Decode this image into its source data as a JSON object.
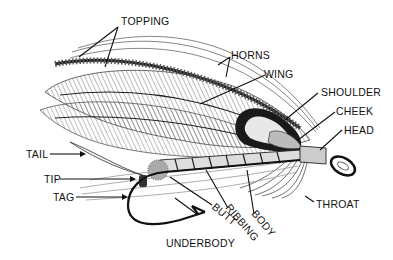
{
  "diagram": {
    "labels": {
      "topping": "TOPPING",
      "horns": "HORNS",
      "wing": "WING",
      "shoulder": "SHOULDER",
      "cheek": "CHEEK",
      "head": "HEAD",
      "tail": "TAIL",
      "tip": "TIP",
      "tag": "TAG",
      "throat": "THROAT",
      "body": "BODY",
      "ribbing": "RIBBING",
      "butt": "BUTT",
      "underbody": "UNDERBODY"
    }
  },
  "colors": {
    "ink": "#111111",
    "background": "#ffffff"
  }
}
